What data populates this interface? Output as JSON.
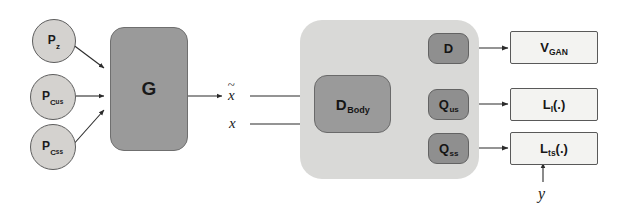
{
  "diagram": {
    "canvas": {
      "width": 617,
      "height": 213,
      "background": "#ffffff"
    },
    "colors": {
      "panel": "#d9d9d7",
      "dark_block": "#8f8f8f",
      "mid_block": "#9a9a9a",
      "circle_fill": "#d4d2cf",
      "out_box_fill": "#f3f3f1",
      "stroke": "#5d5d5d",
      "arrow": "#2b2b2b"
    },
    "priors": [
      {
        "id": "p-z",
        "base": "P",
        "sub": "z",
        "subsub": "",
        "label": "P_z"
      },
      {
        "id": "p-cus",
        "base": "P",
        "sub": "C",
        "subsub": "us",
        "label": "P_Cus"
      },
      {
        "id": "p-css",
        "base": "P",
        "sub": "C",
        "subsub": "ss",
        "label": "P_Css"
      }
    ],
    "generator": {
      "label": "G"
    },
    "signals": {
      "generated": "x",
      "generated_mark": "~",
      "real": "x",
      "condition": "y"
    },
    "discriminator": {
      "body": {
        "base": "D",
        "sub": "Body",
        "label": "D_Body"
      },
      "heads": [
        {
          "id": "head-d",
          "base": "D",
          "sub": "",
          "label": "D"
        },
        {
          "id": "head-qus",
          "base": "Q",
          "sub": "us",
          "label": "Q_us"
        },
        {
          "id": "head-qss",
          "base": "Q",
          "sub": "ss",
          "label": "Q_ss"
        }
      ]
    },
    "outputs": [
      {
        "id": "out-vgan",
        "base": "V",
        "sub": "GAN",
        "tail": "",
        "label": "V_GAN"
      },
      {
        "id": "out-li",
        "base": "L",
        "sub": "I",
        "tail": "(.)",
        "label": "L_I(.)"
      },
      {
        "id": "out-lts",
        "base": "L",
        "sub": "ts",
        "tail": "(.)",
        "label": "L_ts(.)"
      }
    ]
  }
}
